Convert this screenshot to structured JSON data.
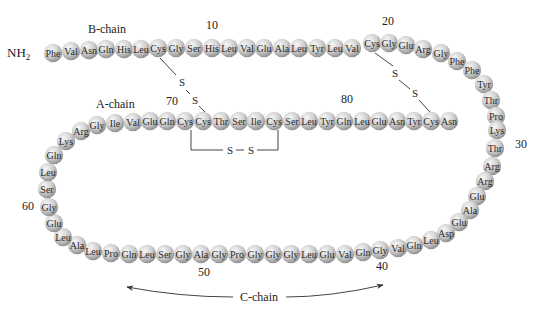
{
  "colors": {
    "bead_light": "#f2f2f2",
    "bead_mid": "#c4c4c4",
    "bead_dark": "#8f8f8f",
    "text": "#222222",
    "line": "#444444"
  },
  "labels": {
    "n_terminus": "NH",
    "n_terminus_sub": "2",
    "b_chain": "B-chain",
    "a_chain": "A-chain",
    "c_chain": "C-chain",
    "disulfide_s": "S"
  },
  "position_numbers": [
    {
      "text": "10",
      "x": 212,
      "y": 29
    },
    {
      "text": "20",
      "x": 388,
      "y": 25
    },
    {
      "text": "30",
      "x": 521,
      "y": 148
    },
    {
      "text": "40",
      "x": 382,
      "y": 270
    },
    {
      "text": "50",
      "x": 204,
      "y": 276
    },
    {
      "text": "60",
      "x": 28,
      "y": 210
    },
    {
      "text": "70",
      "x": 172,
      "y": 105
    },
    {
      "text": "80",
      "x": 347,
      "y": 103
    }
  ],
  "residues": [
    {
      "n": 1,
      "aa": "Phe",
      "x": 53,
      "y": 53
    },
    {
      "n": 2,
      "aa": "Val",
      "x": 71,
      "y": 51
    },
    {
      "n": 3,
      "aa": "Asn",
      "x": 89,
      "y": 50
    },
    {
      "n": 4,
      "aa": "Gln",
      "x": 106,
      "y": 49
    },
    {
      "n": 5,
      "aa": "His",
      "x": 124,
      "y": 49
    },
    {
      "n": 6,
      "aa": "Leu",
      "x": 141,
      "y": 49
    },
    {
      "n": 7,
      "aa": "Cys",
      "x": 158,
      "y": 48
    },
    {
      "n": 8,
      "aa": "Gly",
      "x": 176,
      "y": 48
    },
    {
      "n": 9,
      "aa": "Ser",
      "x": 194,
      "y": 48
    },
    {
      "n": 10,
      "aa": "His",
      "x": 212,
      "y": 48
    },
    {
      "n": 11,
      "aa": "Leu",
      "x": 229,
      "y": 48
    },
    {
      "n": 12,
      "aa": "Val",
      "x": 247,
      "y": 48
    },
    {
      "n": 13,
      "aa": "Glu",
      "x": 264,
      "y": 48
    },
    {
      "n": 14,
      "aa": "Ala",
      "x": 282,
      "y": 48
    },
    {
      "n": 15,
      "aa": "Leu",
      "x": 299,
      "y": 48
    },
    {
      "n": 16,
      "aa": "Tyr",
      "x": 317,
      "y": 48
    },
    {
      "n": 17,
      "aa": "Leu",
      "x": 335,
      "y": 48
    },
    {
      "n": 18,
      "aa": "Val",
      "x": 352,
      "y": 48
    },
    {
      "n": 19,
      "aa": "Cys",
      "x": 372,
      "y": 43
    },
    {
      "n": 20,
      "aa": "Gly",
      "x": 389,
      "y": 43
    },
    {
      "n": 21,
      "aa": "Glu",
      "x": 406,
      "y": 45
    },
    {
      "n": 22,
      "aa": "Arg",
      "x": 423,
      "y": 49
    },
    {
      "n": 23,
      "aa": "Gly",
      "x": 441,
      "y": 53
    },
    {
      "n": 24,
      "aa": "Phe",
      "x": 457,
      "y": 61
    },
    {
      "n": 25,
      "aa": "Phe",
      "x": 472,
      "y": 70
    },
    {
      "n": 26,
      "aa": "Tyr",
      "x": 484,
      "y": 84
    },
    {
      "n": 27,
      "aa": "Thr",
      "x": 491,
      "y": 100
    },
    {
      "n": 28,
      "aa": "Pro",
      "x": 496,
      "y": 116
    },
    {
      "n": 29,
      "aa": "Lys",
      "x": 497,
      "y": 130
    },
    {
      "n": 30,
      "aa": "Thr",
      "x": 495,
      "y": 148
    },
    {
      "n": 31,
      "aa": "Arg",
      "x": 492,
      "y": 166
    },
    {
      "n": 32,
      "aa": "Arg",
      "x": 485,
      "y": 181
    },
    {
      "n": 33,
      "aa": "Glu",
      "x": 477,
      "y": 196
    },
    {
      "n": 34,
      "aa": "Ala",
      "x": 470,
      "y": 210
    },
    {
      "n": 35,
      "aa": "Glu",
      "x": 459,
      "y": 222
    },
    {
      "n": 36,
      "aa": "Asp",
      "x": 446,
      "y": 233
    },
    {
      "n": 37,
      "aa": "Leu",
      "x": 431,
      "y": 240
    },
    {
      "n": 38,
      "aa": "Gln",
      "x": 414,
      "y": 245
    },
    {
      "n": 39,
      "aa": "Val",
      "x": 398,
      "y": 248
    },
    {
      "n": 40,
      "aa": "Gly",
      "x": 380,
      "y": 250
    },
    {
      "n": 41,
      "aa": "Gln",
      "x": 363,
      "y": 252
    },
    {
      "n": 42,
      "aa": "Val",
      "x": 345,
      "y": 254
    },
    {
      "n": 43,
      "aa": "Glu",
      "x": 327,
      "y": 254
    },
    {
      "n": 44,
      "aa": "Leu",
      "x": 309,
      "y": 254
    },
    {
      "n": 45,
      "aa": "Gly",
      "x": 291,
      "y": 254
    },
    {
      "n": 46,
      "aa": "Gly",
      "x": 273,
      "y": 254
    },
    {
      "n": 47,
      "aa": "Gly",
      "x": 255,
      "y": 254
    },
    {
      "n": 48,
      "aa": "Pro",
      "x": 237,
      "y": 254
    },
    {
      "n": 49,
      "aa": "Gly",
      "x": 219,
      "y": 254
    },
    {
      "n": 50,
      "aa": "Ala",
      "x": 201,
      "y": 254
    },
    {
      "n": 51,
      "aa": "Gly",
      "x": 183,
      "y": 254
    },
    {
      "n": 52,
      "aa": "Ser",
      "x": 165,
      "y": 254
    },
    {
      "n": 53,
      "aa": "Leu",
      "x": 147,
      "y": 254
    },
    {
      "n": 54,
      "aa": "Gln",
      "x": 129,
      "y": 254
    },
    {
      "n": 55,
      "aa": "Pro",
      "x": 111,
      "y": 253
    },
    {
      "n": 56,
      "aa": "Leu",
      "x": 93,
      "y": 251
    },
    {
      "n": 57,
      "aa": "Ala",
      "x": 77,
      "y": 245
    },
    {
      "n": 58,
      "aa": "Leu",
      "x": 63,
      "y": 237
    },
    {
      "n": 59,
      "aa": "Glu",
      "x": 54,
      "y": 223
    },
    {
      "n": 60,
      "aa": "Gly",
      "x": 49,
      "y": 207
    },
    {
      "n": 61,
      "aa": "Ser",
      "x": 47,
      "y": 189
    },
    {
      "n": 62,
      "aa": "Leu",
      "x": 48,
      "y": 172
    },
    {
      "n": 63,
      "aa": "Gln",
      "x": 54,
      "y": 155
    },
    {
      "n": 64,
      "aa": "Lys",
      "x": 66,
      "y": 141
    },
    {
      "n": 65,
      "aa": "Arg",
      "x": 81,
      "y": 131
    },
    {
      "n": 66,
      "aa": "Gly",
      "x": 97,
      "y": 125
    },
    {
      "n": 67,
      "aa": "Ile",
      "x": 115,
      "y": 123
    },
    {
      "n": 68,
      "aa": "Val",
      "x": 133,
      "y": 122
    },
    {
      "n": 69,
      "aa": "Glu",
      "x": 150,
      "y": 121
    },
    {
      "n": 70,
      "aa": "Gln",
      "x": 167,
      "y": 121
    },
    {
      "n": 71,
      "aa": "Cys",
      "x": 185,
      "y": 121
    },
    {
      "n": 72,
      "aa": "Cys",
      "x": 203,
      "y": 121
    },
    {
      "n": 73,
      "aa": "Thr",
      "x": 221,
      "y": 121
    },
    {
      "n": 74,
      "aa": "Ser",
      "x": 239,
      "y": 121
    },
    {
      "n": 75,
      "aa": "Ile",
      "x": 256,
      "y": 121
    },
    {
      "n": 76,
      "aa": "Cys",
      "x": 274,
      "y": 121
    },
    {
      "n": 77,
      "aa": "Ser",
      "x": 292,
      "y": 121
    },
    {
      "n": 78,
      "aa": "Leu",
      "x": 309,
      "y": 121
    },
    {
      "n": 79,
      "aa": "Tyr",
      "x": 327,
      "y": 121
    },
    {
      "n": 80,
      "aa": "Gln",
      "x": 344,
      "y": 121
    },
    {
      "n": 81,
      "aa": "Leu",
      "x": 362,
      "y": 121
    },
    {
      "n": 82,
      "aa": "Glu",
      "x": 379,
      "y": 121
    },
    {
      "n": 83,
      "aa": "Asn",
      "x": 397,
      "y": 121
    },
    {
      "n": 84,
      "aa": "Tyr",
      "x": 414,
      "y": 121
    },
    {
      "n": 85,
      "aa": "Cys",
      "x": 431,
      "y": 121
    },
    {
      "n": 86,
      "aa": "Asn",
      "x": 449,
      "y": 121
    }
  ],
  "disulfide_bonds": [
    {
      "from": "Cys7 (B)",
      "to": "Cys72 (A)"
    },
    {
      "from": "Cys19 (B)",
      "to": "Cys85 (A)"
    },
    {
      "from": "Cys71 (A)",
      "to": "Cys76 (A)"
    }
  ]
}
